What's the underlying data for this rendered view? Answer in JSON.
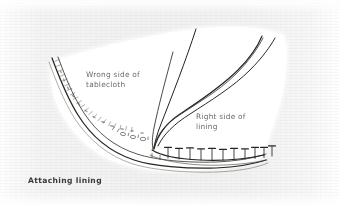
{
  "figure": {
    "caption": "Attaching lining",
    "labels": {
      "wrong_side": "Wrong side of\ntablecloth",
      "right_side": "Right side of\nlining"
    },
    "colors": {
      "background": "#f3f3f4",
      "cloth_fill": "#ffffff",
      "ink": "#2b2a28",
      "label_text": "#6d6a66",
      "caption_text": "#3b3936"
    },
    "icons": {
      "pin": "pin-icon",
      "stitch": "stitch-icon"
    },
    "elements": {
      "cloth_shape": "tablecloth-panel",
      "hem_band": "hem-band",
      "fold_line": "fold-line",
      "lining_curve": "lining-edge-curve",
      "pin_row": "pin-row",
      "pin_count": 11
    }
  }
}
